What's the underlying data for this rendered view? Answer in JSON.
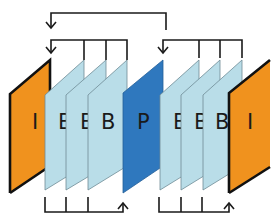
{
  "diagram": {
    "type": "gop-frame-structure",
    "colors": {
      "I": "#F0921E",
      "B": "#B9DDE8",
      "P": "#2F78BE",
      "line": "#1a1a1a"
    },
    "frames": [
      {
        "id": "I0",
        "type": "I",
        "label": "I"
      },
      {
        "id": "B1",
        "type": "B",
        "label": "B"
      },
      {
        "id": "B2",
        "type": "B",
        "label": "B"
      },
      {
        "id": "B3",
        "type": "B",
        "label": "B"
      },
      {
        "id": "P4",
        "type": "P",
        "label": "P"
      },
      {
        "id": "B5",
        "type": "B",
        "label": "B"
      },
      {
        "id": "B6",
        "type": "B",
        "label": "B"
      },
      {
        "id": "B7",
        "type": "B",
        "label": "B"
      },
      {
        "id": "I8",
        "type": "I",
        "label": "I"
      }
    ],
    "references": [
      {
        "from": "P4",
        "to": "I0",
        "position": "top-outer"
      },
      {
        "from": [
          "B1",
          "B2",
          "B3"
        ],
        "to": "I0",
        "position": "top-left-bracket"
      },
      {
        "from": [
          "B5",
          "B6",
          "B7"
        ],
        "to": "P4",
        "position": "top-right-bracket"
      },
      {
        "from": [
          "B1",
          "B2",
          "B3"
        ],
        "to": "P4",
        "position": "bottom-left-bracket"
      },
      {
        "from": [
          "B5",
          "B6",
          "B7"
        ],
        "to": "I8",
        "position": "bottom-right-bracket"
      }
    ]
  }
}
